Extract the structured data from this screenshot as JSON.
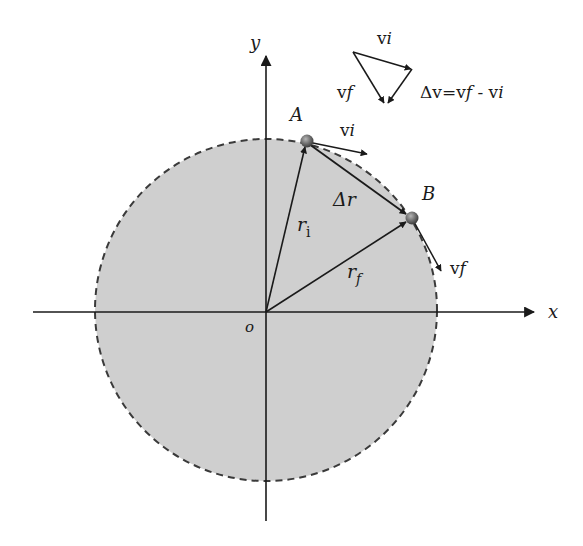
{
  "diagram": {
    "colors": {
      "disc_fill": "#cfcfcf",
      "disc_edge": "#3a3a3a",
      "line": "#1a1a1a",
      "particle": "#6a6a6a",
      "background": "#ffffff"
    },
    "circle": {
      "cx": 266,
      "cy": 310,
      "r": 171,
      "edge_style": "dashed"
    },
    "axes": {
      "x_label": "x",
      "y_label": "y",
      "origin_label": "o"
    },
    "points": [
      {
        "id": "A",
        "label": "A",
        "x": 307,
        "y": 141
      },
      {
        "id": "B",
        "label": "B",
        "x": 412,
        "y": 218
      }
    ],
    "vectors": {
      "r_initial": {
        "label_main": "r",
        "label_sub": "i",
        "from": "o",
        "to": "A"
      },
      "r_final": {
        "label_main": "r",
        "label_sub": "f",
        "from": "o",
        "to": "B"
      },
      "delta_r": {
        "label": "Δr",
        "from": "A",
        "to": "B"
      },
      "v_initial": {
        "label_main": "v",
        "label_sub": "i",
        "at": "A"
      },
      "v_final": {
        "label_main": "v",
        "label_sub": "f",
        "at": "B"
      }
    },
    "velocity_triangle": {
      "vi_label_main": "v",
      "vi_label_sub": "i",
      "vf_label_main": "v",
      "vf_label_sub": "f",
      "equation_prefix": "Δv=v",
      "equation_f": "f",
      "equation_mid": " - v",
      "equation_i": "i"
    }
  }
}
